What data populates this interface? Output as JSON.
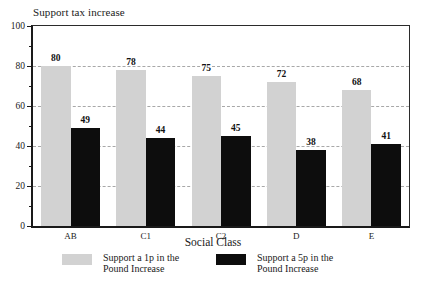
{
  "chart_data": {
    "type": "bar",
    "title": "Support tax increase",
    "xlabel": "Social Class",
    "ylabel": "",
    "categories": [
      "AB",
      "C1",
      "C2",
      "D",
      "E"
    ],
    "series": [
      {
        "name": "Support a 1p in the Pound Increase",
        "name_line1": "Support a 1p in the",
        "name_line2": "Pound Increase",
        "color": "#d2d2d2",
        "values": [
          80,
          78,
          75,
          72,
          68
        ]
      },
      {
        "name": "Support a 5p in the Pound Increase",
        "name_line1": "Support a 5p in the",
        "name_line2": "Pound Increase",
        "color": "#0d0d0d",
        "values": [
          49,
          44,
          45,
          38,
          41
        ]
      }
    ],
    "ylim": [
      0,
      100
    ],
    "yticks": [
      0,
      20,
      40,
      60,
      80,
      100
    ],
    "ytick_labels": [
      "0",
      "20",
      "40",
      "60",
      "80",
      "100"
    ],
    "yticks_minor": [
      10,
      30,
      50,
      70,
      90
    ],
    "gridlines": [
      20,
      40,
      60,
      80
    ],
    "grid": true,
    "grid_style": "dashed",
    "legend_position": "bottom"
  }
}
